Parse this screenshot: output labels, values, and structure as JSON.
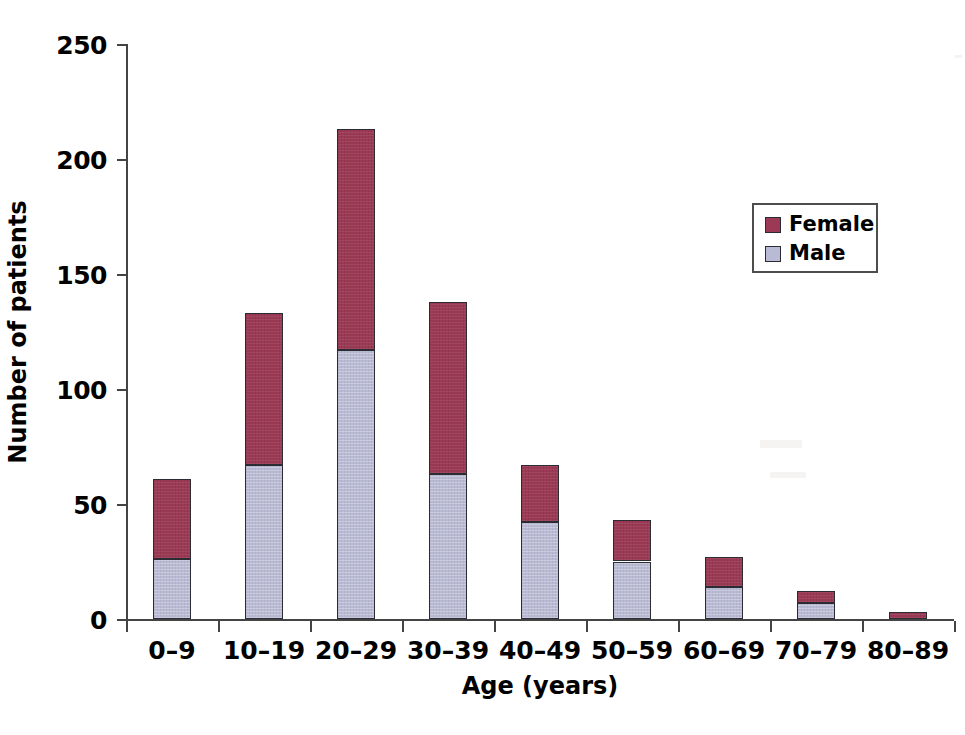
{
  "chart_data": {
    "type": "bar",
    "subtype": "stacked-vertical",
    "title": "",
    "xlabel": "Age (years)",
    "ylabel": "Number of patients",
    "categories": [
      "0–9",
      "10–19",
      "20–29",
      "30–39",
      "40–49",
      "50–59",
      "60–69",
      "70–79",
      "80–89"
    ],
    "series": [
      {
        "name": "Male",
        "color": "#b9bbd4",
        "values": [
          26,
          67,
          117,
          63,
          42,
          25,
          14,
          7,
          0
        ]
      },
      {
        "name": "Female",
        "color": "#9c3a55",
        "values": [
          35,
          66,
          96,
          75,
          25,
          18,
          13,
          5,
          3
        ]
      }
    ],
    "totals": [
      61,
      133,
      213,
      138,
      67,
      43,
      27,
      12,
      3
    ],
    "ylim": [
      0,
      250
    ],
    "yticks": [
      0,
      50,
      100,
      150,
      200,
      250
    ],
    "ytick_labels": [
      "0",
      "50",
      "100",
      "150",
      "200",
      "250"
    ],
    "grid": false,
    "legend_position": "upper-right",
    "legend_entries": [
      "Female",
      "Male"
    ]
  },
  "axis": {
    "y_title": "Number of patients",
    "x_title": "Age (years)"
  },
  "legend": {
    "items": [
      {
        "label": "Female",
        "color": "#9c3a55"
      },
      {
        "label": "Male",
        "color": "#b9bbd4"
      }
    ]
  },
  "colors": {
    "female": "#9c3a55",
    "male": "#b9bbd4",
    "axis": "#444444",
    "text": "#000000",
    "background": "#ffffff"
  }
}
